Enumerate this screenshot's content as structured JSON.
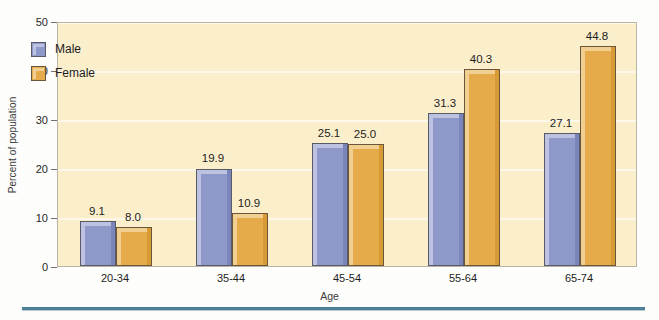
{
  "chart_data": {
    "type": "bar",
    "title": "",
    "xlabel": "Age",
    "ylabel": "Percent of population",
    "categories": [
      "20-34",
      "35-44",
      "45-54",
      "55-64",
      "65-74"
    ],
    "series": [
      {
        "name": "Male",
        "color": "#8e99ca",
        "values": [
          9.1,
          19.9,
          25.1,
          31.3,
          27.1
        ]
      },
      {
        "name": "Female",
        "color": "#e5ab4a",
        "values": [
          8.0,
          10.9,
          25.0,
          40.3,
          44.8
        ]
      }
    ],
    "value_labels": {
      "Male": [
        "9.1",
        "19.9",
        "25.1",
        "31.3",
        "27.1"
      ],
      "Female": [
        "8.0",
        "10.9",
        "25.0",
        "40.3",
        "44.8"
      ]
    },
    "ylim": [
      0,
      50
    ],
    "yticks": [
      0,
      10,
      20,
      30,
      40,
      50
    ],
    "ytick_labels": [
      "0",
      "10",
      "20",
      "30",
      "40",
      "50"
    ],
    "grid": "horizontal",
    "legend_position": "upper-left-inside",
    "plot_background": "#fbeecb",
    "gridline_color": "#fdf8ea"
  },
  "legend": {
    "items": [
      {
        "label": "Male"
      },
      {
        "label": "Female"
      }
    ]
  },
  "axes": {
    "y_title": "Percent of population",
    "x_title": "Age"
  }
}
